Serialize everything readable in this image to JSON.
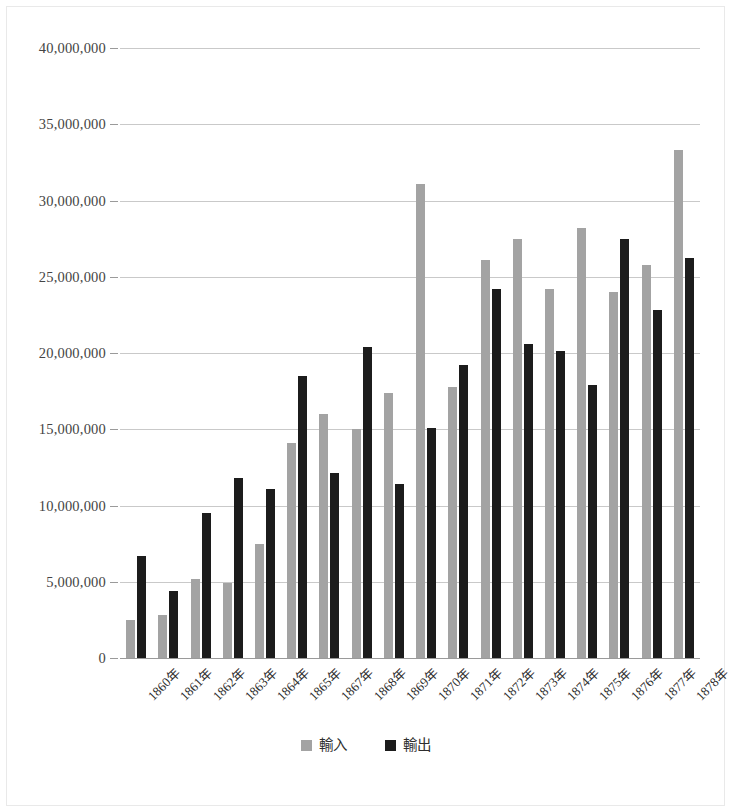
{
  "chart_data": {
    "type": "bar",
    "title": "",
    "subtitle": "",
    "xlabel": "",
    "ylabel": "",
    "ylim": [
      0,
      40000000
    ],
    "ytick_values": [
      0,
      5000000,
      10000000,
      15000000,
      20000000,
      25000000,
      30000000,
      35000000,
      40000000
    ],
    "ytick_labels": [
      "0",
      "5,000,000",
      "10,000,000",
      "15,000,000",
      "20,000,000",
      "25,000,000",
      "30,000,000",
      "35,000,000",
      "40,000,000"
    ],
    "grid": true,
    "legend_position": "bottom",
    "categories": [
      "1860年",
      "1861年",
      "1862年",
      "1863年",
      "1864年",
      "1865年",
      "1867年",
      "1868年",
      "1869年",
      "1870年",
      "1871年",
      "1872年",
      "1873年",
      "1874年",
      "1875年",
      "1876年",
      "1877年",
      "1878年"
    ],
    "series": [
      {
        "name": "輸入",
        "color": "#a3a3a3",
        "values": [
          2500000,
          2800000,
          5200000,
          4900000,
          7500000,
          14100000,
          16000000,
          15000000,
          17400000,
          31100000,
          17800000,
          26100000,
          27500000,
          24200000,
          28200000,
          24000000,
          25800000,
          33300000
        ]
      },
      {
        "name": "輸出",
        "color": "#1c1c1c",
        "values": [
          6700000,
          4400000,
          9500000,
          11800000,
          11100000,
          18500000,
          12100000,
          20400000,
          11400000,
          15100000,
          19200000,
          24200000,
          20600000,
          20100000,
          17900000,
          27500000,
          22800000,
          26200000
        ]
      }
    ]
  },
  "legend": {
    "entries": [
      {
        "label": "輸入",
        "color": "#a3a3a3"
      },
      {
        "label": "輸出",
        "color": "#1c1c1c"
      }
    ]
  },
  "colors": {
    "imports": "#a3a3a3",
    "exports": "#1c1c1c",
    "gridline": "#c9c9c9",
    "axis": "#9a9a9a",
    "text": "#2e2e2e",
    "background": "#ffffff"
  }
}
